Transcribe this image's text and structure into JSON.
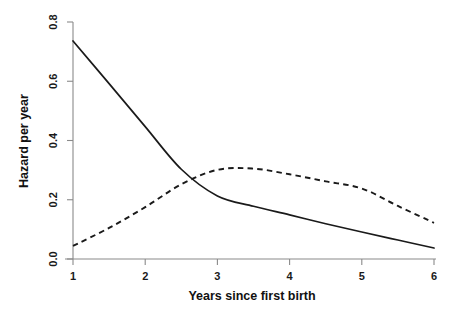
{
  "chart_data": {
    "type": "line",
    "title": "",
    "xlabel": "Years since first birth",
    "ylabel": "Hazard per year",
    "xlim": [
      1,
      6
    ],
    "ylim": [
      0,
      0.8
    ],
    "grid": false,
    "legend": "none",
    "xticks": [
      "1",
      "2",
      "3",
      "4",
      "5",
      "6"
    ],
    "xtick_values": [
      1,
      2,
      3,
      4,
      5,
      6
    ],
    "yticks": [
      "0.0",
      "0.2",
      "0.4",
      "0.6",
      "0.8"
    ],
    "ytick_values": [
      0.0,
      0.2,
      0.4,
      0.6,
      0.8
    ],
    "x": [
      1,
      1.5,
      2,
      2.5,
      3,
      3.5,
      4,
      4.5,
      5,
      5.5,
      6
    ],
    "series": [
      {
        "name": "solid-curve",
        "style": "solid",
        "color": "#1a1a1a",
        "values": [
          0.736,
          0.592,
          0.447,
          0.303,
          0.213,
          0.178,
          0.149,
          0.119,
          0.091,
          0.064,
          0.037
        ]
      },
      {
        "name": "dashed-curve",
        "style": "dashed",
        "color": "#1a1a1a",
        "values": [
          0.044,
          0.105,
          0.175,
          0.252,
          0.301,
          0.305,
          0.286,
          0.262,
          0.238,
          0.179,
          0.122
        ]
      }
    ],
    "annotations": {
      "crossing_point": {
        "x": 2.53,
        "y": 0.294
      },
      "dashed_peak": {
        "x": 3.2,
        "y": 0.306
      }
    }
  },
  "axis": {
    "y_title": "Hazard per year",
    "x_title": "Years since first birth"
  }
}
